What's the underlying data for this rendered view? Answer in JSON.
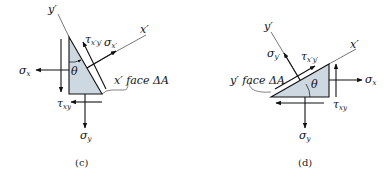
{
  "colors": {
    "element_fill": "#cdd8e1",
    "line": "#111111",
    "axis": "#555555"
  },
  "panel_c": {
    "caption": "(c)",
    "axis_y_prime": "y′",
    "axis_x_prime": "x′",
    "angle": "θ",
    "face_label": "x′ face ΔA",
    "sigma_x": "σ",
    "sigma_x_sub": "x",
    "sigma_y": "σ",
    "sigma_y_sub": "y",
    "tau_xy": "τ",
    "tau_xy_sub": "xy",
    "sigma_xp": "σ",
    "sigma_xp_sub": "x′",
    "tau_xpyp": "τ",
    "tau_xpyp_sub": "x′y′"
  },
  "panel_d": {
    "caption": "(d)",
    "axis_y_prime": "y′",
    "axis_x_prime": "x′",
    "angle": "θ",
    "face_label": "y′ face ΔA",
    "sigma_x": "σ",
    "sigma_x_sub": "x",
    "sigma_y": "σ",
    "sigma_y_sub": "y",
    "tau_xy": "τ",
    "tau_xy_sub": "xy",
    "sigma_yp": "σ",
    "sigma_yp_sub": "y′",
    "tau_xpyp": "τ",
    "tau_xpyp_sub": "x′y′"
  }
}
